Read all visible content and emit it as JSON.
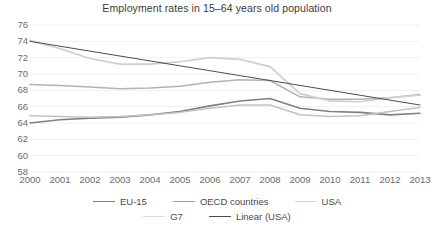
{
  "chart_data": {
    "type": "line",
    "title": "Employment rates in 15–64 years old population",
    "xlabel": "",
    "ylabel": "",
    "x": [
      2000,
      2001,
      2002,
      2003,
      2004,
      2005,
      2006,
      2007,
      2008,
      2009,
      2010,
      2011,
      2012,
      2013
    ],
    "categories": [
      "2000",
      "2001",
      "2002",
      "2003",
      "2004",
      "2005",
      "2006",
      "2007",
      "2008",
      "2009",
      "2010",
      "2011",
      "2012",
      "2013"
    ],
    "ylim": [
      58,
      76
    ],
    "yticks": [
      58,
      60,
      62,
      64,
      66,
      68,
      70,
      72,
      74,
      76
    ],
    "xlim": [
      2000,
      2013
    ],
    "grid": true,
    "grid_axis": "y",
    "legend_position": "bottom",
    "series": [
      {
        "name": "EU-15",
        "color": "#808080",
        "width": 1.6,
        "values": [
          64.0,
          64.4,
          64.6,
          64.7,
          65.0,
          65.4,
          66.1,
          66.7,
          67.0,
          65.8,
          65.4,
          65.3,
          65.0,
          65.2
        ]
      },
      {
        "name": "OECD countries",
        "color": "#b3b3b3",
        "width": 1.5,
        "values": [
          68.7,
          68.6,
          68.4,
          68.2,
          68.3,
          68.5,
          69.0,
          69.3,
          69.2,
          67.2,
          66.9,
          66.9,
          67.1,
          67.5
        ]
      },
      {
        "name": "USA",
        "color": "#cfcfcf",
        "width": 1.7,
        "values": [
          74.1,
          73.1,
          71.9,
          71.2,
          71.2,
          71.5,
          72.0,
          71.8,
          70.9,
          67.6,
          66.7,
          66.6,
          67.1,
          67.4
        ]
      },
      {
        "name": "G7",
        "color": "#c2c2c2",
        "width": 1.5,
        "values": [
          64.9,
          64.8,
          64.7,
          64.8,
          65.0,
          65.3,
          65.8,
          66.2,
          66.2,
          65.0,
          64.8,
          64.9,
          65.4,
          65.9
        ]
      },
      {
        "name": "Linear (USA)",
        "color": "#4d4d4d",
        "width": 1.0,
        "values": [
          74.0,
          73.4,
          72.8,
          72.2,
          71.6,
          71.0,
          70.4,
          69.8,
          69.2,
          68.6,
          68.0,
          67.4,
          66.8,
          66.2
        ]
      }
    ]
  },
  "legend": {
    "items": [
      {
        "label": "EU-15",
        "color": "#808080"
      },
      {
        "label": "OECD countries",
        "color": "#9e9e9e"
      },
      {
        "label": "USA",
        "color": "#d2d2d2"
      },
      {
        "label": "G7",
        "color": "#dcdcdc"
      },
      {
        "label": "Linear (USA)",
        "color": "#4d4d4d"
      }
    ]
  },
  "footer": {
    "cut_text": ""
  }
}
